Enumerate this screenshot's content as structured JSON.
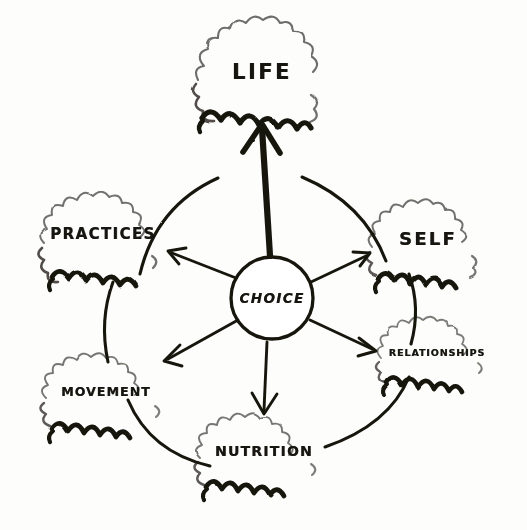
{
  "diagram": {
    "style": "hand-drawn sketch, black ink on white paper",
    "ink_color": "#17150f",
    "paper_color": "#fdfdfc",
    "center": {
      "id": "choice",
      "label": "CHOICE",
      "shape": "circle",
      "x": 272,
      "y": 298
    },
    "nodes": [
      {
        "id": "life",
        "label": "LIFE",
        "shape": "burst",
        "x": 262,
        "y": 72,
        "arrow": "thick-up"
      },
      {
        "id": "practices",
        "label": "PRACTICES",
        "shape": "burst",
        "x": 103,
        "y": 234,
        "arrow": "thin-up-left"
      },
      {
        "id": "self",
        "label": "SELF",
        "shape": "burst",
        "x": 428,
        "y": 238,
        "arrow": "thin-up-right"
      },
      {
        "id": "movement",
        "label": "MOVEMENT",
        "shape": "burst",
        "x": 106,
        "y": 391,
        "arrow": "thin-down-left"
      },
      {
        "id": "relationships",
        "label": "RELATIONSHIPS",
        "shape": "burst",
        "x": 437,
        "y": 352,
        "arrow": "thin-down-right"
      },
      {
        "id": "nutrition",
        "label": "NUTRITION",
        "shape": "burst",
        "x": 264,
        "y": 451,
        "arrow": "thin-down"
      }
    ],
    "connectors": [
      {
        "from": "practices",
        "to": "life",
        "type": "arc"
      },
      {
        "from": "life",
        "to": "self",
        "type": "arc"
      },
      {
        "from": "practices",
        "to": "movement",
        "type": "arc"
      },
      {
        "from": "self",
        "to": "relationships",
        "type": "arc"
      },
      {
        "from": "movement",
        "to": "nutrition",
        "type": "arc"
      },
      {
        "from": "relationships",
        "to": "nutrition",
        "type": "arc"
      }
    ]
  }
}
